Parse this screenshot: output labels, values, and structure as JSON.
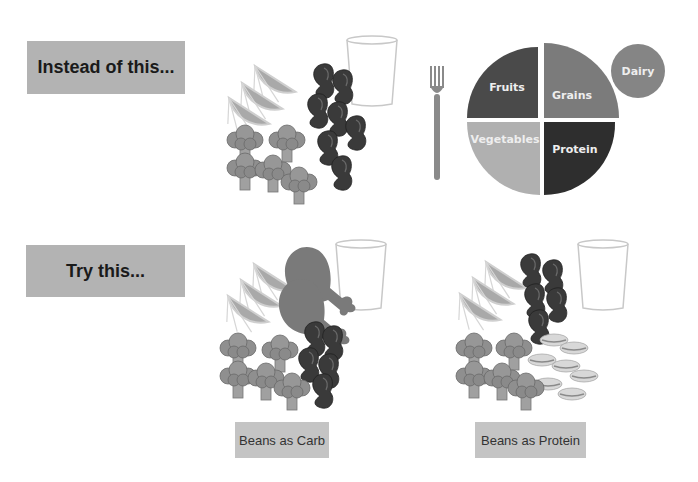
{
  "rows": {
    "instead": {
      "label": "Instead of this..."
    },
    "try": {
      "label": "Try this..."
    }
  },
  "plate_chart": {
    "segments": [
      {
        "name": "Fruits",
        "color": "#4a4a4a"
      },
      {
        "name": "Grains",
        "color": "#7b7b7b"
      },
      {
        "name": "Vegetables",
        "color": "#b0b0b0"
      },
      {
        "name": "Protein",
        "color": "#2e2e2e"
      }
    ],
    "side_circle": {
      "name": "Dairy",
      "color": "#858585"
    }
  },
  "captions": {
    "beans_as_carb": "Beans as Carb",
    "beans_as_protein": "Beans as Protein"
  },
  "colors": {
    "box_gray": "#b3b3b3",
    "caption_gray": "#c4c4c4",
    "beans": "#3a3a3a",
    "orange": "#a9a9a9",
    "broccoli": "#8f8f8f",
    "chicken": "#7a7a7a"
  }
}
